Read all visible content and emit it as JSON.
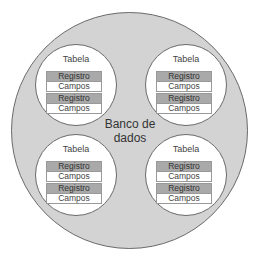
{
  "diagram": {
    "database": {
      "label_line1": "Banco de",
      "label_line2": "dados"
    },
    "tables": [
      {
        "title": "Tabela",
        "records": [
          {
            "header": "Registro",
            "fields": "Campos"
          },
          {
            "header": "Registro",
            "fields": "Campos"
          }
        ]
      },
      {
        "title": "Tabela",
        "records": [
          {
            "header": "Registro",
            "fields": "Campos"
          },
          {
            "header": "Registro",
            "fields": "Campos"
          }
        ]
      },
      {
        "title": "Tabela",
        "records": [
          {
            "header": "Registro",
            "fields": "Campos"
          },
          {
            "header": "Registro",
            "fields": "Campos"
          }
        ]
      },
      {
        "title": "Tabela",
        "records": [
          {
            "header": "Registro",
            "fields": "Campos"
          },
          {
            "header": "Registro",
            "fields": "Campos"
          }
        ]
      }
    ],
    "colors": {
      "database_fill": "#d3d3d3",
      "record_header_fill": "#a9a9a9",
      "table_fill": "#ffffff",
      "outline": "#6a6a6a"
    }
  }
}
